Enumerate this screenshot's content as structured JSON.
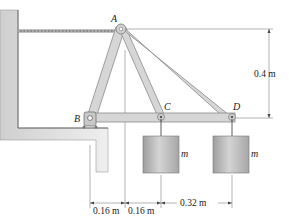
{
  "figure": {
    "points": {
      "A": "A",
      "B": "B",
      "C": "C",
      "D": "D"
    },
    "masses": [
      {
        "id": "mass-C",
        "label": "m",
        "attached_to": "C"
      },
      {
        "id": "mass-D",
        "label": "m",
        "attached_to": "D"
      }
    ],
    "dimensions": {
      "height": "0.4 m",
      "b_to_a": "0.16 m",
      "a_to_c": "0.16 m",
      "c_to_d": "0.32 m"
    },
    "colors": {
      "member_fill": "#d6d6d6",
      "member_stroke": "#8a8a8a",
      "wall_fill": "#e3e3e3",
      "mass_fill": "#bdbdbd",
      "line": "#444444"
    }
  }
}
